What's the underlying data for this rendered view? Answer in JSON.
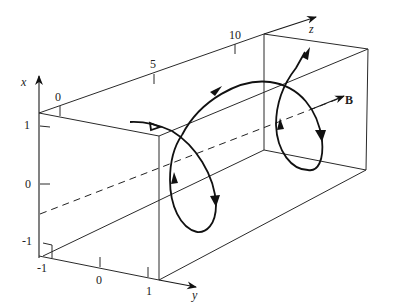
{
  "figure": {
    "axes": {
      "x": {
        "label": "x",
        "ticks": [
          "1",
          "0",
          "-1"
        ]
      },
      "y": {
        "label": "y",
        "ticks": [
          "-1",
          "0",
          "1"
        ]
      },
      "z": {
        "label": "z",
        "ticks": [
          "0",
          "5",
          "10"
        ]
      }
    },
    "field_label": "B"
  }
}
